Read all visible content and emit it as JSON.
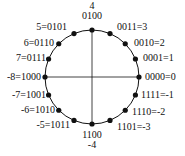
{
  "diagram": {
    "center": [
      92,
      77
    ],
    "radius": 47,
    "top_label": {
      "value": "4",
      "code": "0100"
    },
    "bottom_label": {
      "code": "1100",
      "value": "-4"
    },
    "points": [
      {
        "code": "0000",
        "value": "0",
        "label": "0000=0",
        "angle": 0
      },
      {
        "code": "0001",
        "value": "1",
        "label": "0001=1",
        "angle": 22.5
      },
      {
        "code": "0010",
        "value": "2",
        "label": "0010=2",
        "angle": 45
      },
      {
        "code": "0011",
        "value": "3",
        "label": "0011=3",
        "angle": 67.5
      },
      {
        "code": "0100",
        "value": "4",
        "label": "0100",
        "angle": 90
      },
      {
        "code": "0101",
        "value": "5",
        "label": "5=0101",
        "angle": 112.5
      },
      {
        "code": "0110",
        "value": "6",
        "label": "6=0110",
        "angle": 135
      },
      {
        "code": "0111",
        "value": "7",
        "label": "7=0111",
        "angle": 157.5
      },
      {
        "code": "1000",
        "value": "-8",
        "label": "-8=1000",
        "angle": 180
      },
      {
        "code": "1001",
        "value": "-7",
        "label": "-7=1001",
        "angle": 202.5
      },
      {
        "code": "1010",
        "value": "-6",
        "label": "-6=1010",
        "angle": 225
      },
      {
        "code": "1011",
        "value": "-5",
        "label": "-5=1011",
        "angle": 247.5
      },
      {
        "code": "1100",
        "value": "-4",
        "label": "1100",
        "angle": 270
      },
      {
        "code": "1101",
        "value": "-3",
        "label": "1101=-3",
        "angle": 292.5
      },
      {
        "code": "1110",
        "value": "-2",
        "label": "1110=-2",
        "angle": 315
      },
      {
        "code": "1111",
        "value": "-1",
        "label": "1111=-1",
        "angle": 337.5
      }
    ],
    "colors": {
      "stroke": "#111111",
      "background": "#ffffff"
    }
  }
}
